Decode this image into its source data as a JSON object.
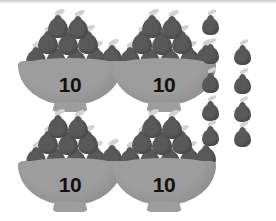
{
  "worksheet": {
    "title": "Place value bowls of ten with loose ones",
    "fruit_icon": "pear-icon",
    "bowl_icon": "bowl-icon",
    "colors": {
      "background": "#ffffff",
      "fruit": "#595959",
      "stem": "#d2d2d2",
      "bowl": "#9d9d9d",
      "label_text": "#111111",
      "top_rule": "#c9c9c9"
    },
    "bowls": [
      {
        "id": "bowl-1",
        "label": "10",
        "position": {
          "left": 18,
          "top": 14
        },
        "fruit_count": 10,
        "rows": [
          2,
          3,
          5
        ]
      },
      {
        "id": "bowl-2",
        "label": "10",
        "position": {
          "left": 112,
          "top": 14
        },
        "fruit_count": 10,
        "rows": [
          2,
          3,
          5
        ]
      },
      {
        "id": "bowl-3",
        "label": "10",
        "position": {
          "left": 18,
          "top": 114
        },
        "fruit_count": 10,
        "rows": [
          2,
          3,
          5
        ]
      },
      {
        "id": "bowl-4",
        "label": "10",
        "position": {
          "left": 112,
          "top": 114
        },
        "fruit_count": 10,
        "rows": [
          2,
          3,
          5
        ]
      }
    ],
    "loose_fruits": {
      "count": 9,
      "rows": [
        1,
        2,
        2,
        2,
        2
      ],
      "positions": [
        {
          "left": 6,
          "top": 0
        },
        {
          "left": 6,
          "top": 29
        },
        {
          "left": 38,
          "top": 30
        },
        {
          "left": 6,
          "top": 58
        },
        {
          "left": 38,
          "top": 59
        },
        {
          "left": 6,
          "top": 86
        },
        {
          "left": 38,
          "top": 87
        },
        {
          "left": 6,
          "top": 111
        },
        {
          "left": 38,
          "top": 112
        }
      ]
    },
    "pile_layout": {
      "row_top": [
        {
          "left": 30,
          "top": 0
        },
        {
          "left": 50,
          "top": 1
        }
      ],
      "row_middle": [
        {
          "left": 20,
          "top": 16
        },
        {
          "left": 40,
          "top": 17
        },
        {
          "left": 60,
          "top": 16
        }
      ],
      "row_bottom": [
        {
          "left": 8,
          "top": 32
        },
        {
          "left": 28,
          "top": 33
        },
        {
          "left": 48,
          "top": 33
        },
        {
          "left": 68,
          "top": 32
        },
        {
          "left": 84,
          "top": 30
        }
      ]
    },
    "totals": {
      "tens": 4,
      "ones": 9,
      "total": 49
    }
  }
}
